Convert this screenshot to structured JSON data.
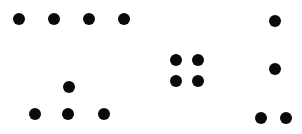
{
  "canvas": {
    "width": 302,
    "height": 134,
    "background": "#ffffff",
    "dot_color": "#0a0a0a",
    "dot_diameter": 12
  },
  "groups": [
    {
      "name": "horizontal-row",
      "dots": [
        [
          19,
          19
        ],
        [
          54,
          19
        ],
        [
          89,
          19
        ],
        [
          124,
          19
        ]
      ]
    },
    {
      "name": "triangle",
      "dots": [
        [
          69,
          87
        ],
        [
          35,
          114
        ],
        [
          68,
          114
        ],
        [
          104,
          114
        ]
      ]
    },
    {
      "name": "square",
      "dots": [
        [
          176,
          60
        ],
        [
          198,
          60
        ],
        [
          176,
          81
        ],
        [
          198,
          81
        ]
      ]
    },
    {
      "name": "vertical-with-foot",
      "dots": [
        [
          275,
          21
        ],
        [
          275,
          69
        ],
        [
          261,
          118
        ],
        [
          286,
          118
        ]
      ]
    }
  ]
}
